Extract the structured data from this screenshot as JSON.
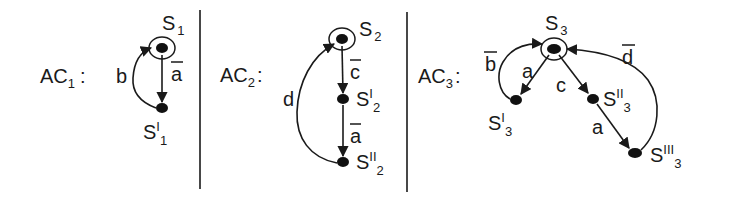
{
  "diagram": {
    "type": "state-automata",
    "panels": [
      {
        "id": "AC1",
        "label": "AC",
        "label_sub": "1",
        "label_suffix": ":",
        "states": [
          {
            "name": "S",
            "prime": "",
            "sub": "1",
            "initial": true
          },
          {
            "name": "S",
            "prime": "I",
            "sub": "1",
            "initial": false
          }
        ],
        "transitions": [
          {
            "from": "S1",
            "to": "S'1",
            "label": "a",
            "negated": true
          },
          {
            "from": "S'1",
            "to": "S1",
            "label": "b",
            "negated": false
          }
        ]
      },
      {
        "id": "AC2",
        "label": "AC",
        "label_sub": "2",
        "label_suffix": ":",
        "states": [
          {
            "name": "S",
            "prime": "",
            "sub": "2",
            "initial": true
          },
          {
            "name": "S",
            "prime": "I",
            "sub": "2",
            "initial": false
          },
          {
            "name": "S",
            "prime": "II",
            "sub": "2",
            "initial": false
          }
        ],
        "transitions": [
          {
            "from": "S2",
            "to": "S'2",
            "label": "c",
            "negated": true
          },
          {
            "from": "S'2",
            "to": "S''2",
            "label": "a",
            "negated": true
          },
          {
            "from": "S''2",
            "to": "S2",
            "label": "d",
            "negated": false
          }
        ]
      },
      {
        "id": "AC3",
        "label": "AC",
        "label_sub": "3",
        "label_suffix": ":",
        "states": [
          {
            "name": "S",
            "prime": "",
            "sub": "3",
            "initial": true
          },
          {
            "name": "S",
            "prime": "I",
            "sub": "3",
            "initial": false
          },
          {
            "name": "S",
            "prime": "II",
            "sub": "3",
            "initial": false
          },
          {
            "name": "S",
            "prime": "III",
            "sub": "3",
            "initial": false
          }
        ],
        "transitions": [
          {
            "from": "S3",
            "to": "S'3",
            "label": "a",
            "negated": false
          },
          {
            "from": "S'3",
            "to": "S3",
            "label": "b",
            "negated": true
          },
          {
            "from": "S3",
            "to": "S''3",
            "label": "c",
            "negated": false
          },
          {
            "from": "S''3",
            "to": "S'''3",
            "label": "a",
            "negated": false
          },
          {
            "from": "S'''3",
            "to": "S3",
            "label": "d",
            "negated": true
          }
        ]
      }
    ]
  },
  "labels": {
    "ac": "AC",
    "colon": ":",
    "s": "S",
    "sub1": "1",
    "sub2": "2",
    "sub3": "3",
    "p1": "I",
    "p2": "II",
    "p3": "III",
    "a": "a",
    "b": "b",
    "c": "c",
    "d": "d"
  }
}
